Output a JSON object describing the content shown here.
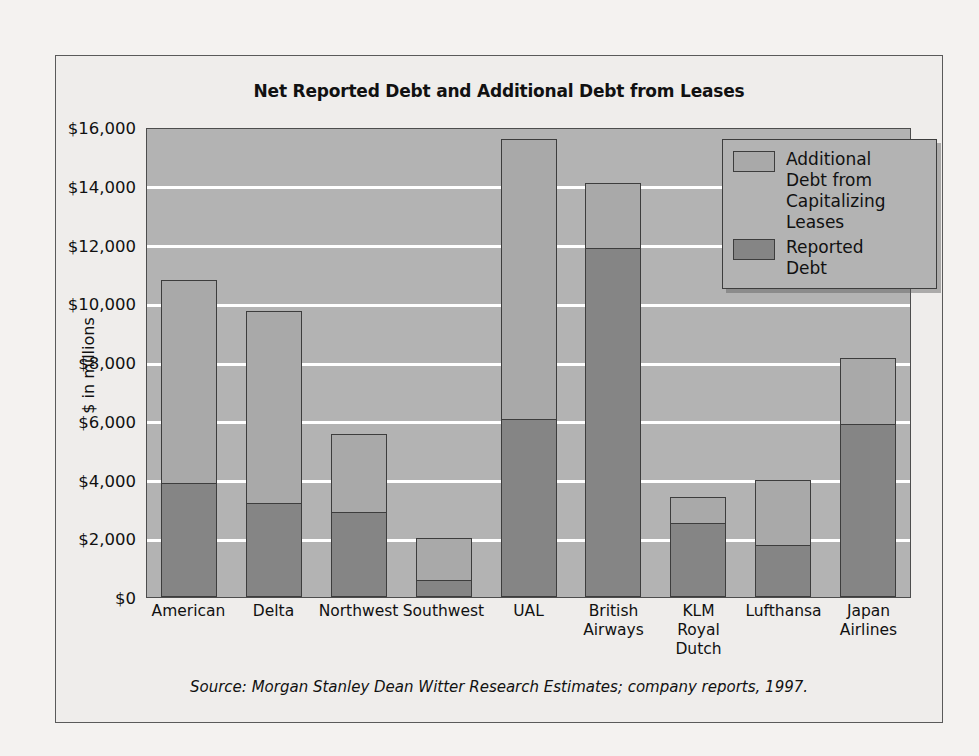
{
  "figure": {
    "title": "Net Reported Debt and Additional Debt from Leases",
    "source": "Source: Morgan Stanley Dean Witter Research Estimates; company reports, 1997.",
    "colors": {
      "page_background": "#f4f2f0",
      "frame_background": "#efedeb",
      "plot_background": "#b3b3b3",
      "gridline": "#ffffff",
      "additional_debt": "#a9a9a9",
      "reported_debt": "#858585",
      "outline": "#3d3d3d",
      "text": "#111111"
    }
  },
  "chart_data": {
    "type": "bar",
    "subtype": "stacked-vertical",
    "title": "Net Reported Debt and Additional Debt from Leases",
    "xlabel": "",
    "ylabel": "$ in millions",
    "ylim": [
      0,
      16000
    ],
    "ytick_step": 2000,
    "ytick_labels": [
      "$16,000",
      "$14,000",
      "$12,000",
      "$10,000",
      "$8,000",
      "$6,000",
      "$4,000",
      "$2,000",
      "$0"
    ],
    "ytick_values": [
      16000,
      14000,
      12000,
      10000,
      8000,
      6000,
      4000,
      2000,
      0
    ],
    "grid": true,
    "grid_axis": "y",
    "legend_position": "top-right-inside",
    "categories": [
      "American",
      "Delta",
      "Northwest",
      "Southwest",
      "UAL",
      "British Airways",
      "KLM Royal Dutch",
      "Lufthansa",
      "Japan Airlines"
    ],
    "category_label_lines": [
      [
        "American"
      ],
      [
        "Delta"
      ],
      [
        "Northwest"
      ],
      [
        "Southwest"
      ],
      [
        "UAL"
      ],
      [
        "British",
        "Airways"
      ],
      [
        "KLM",
        "Royal",
        "Dutch"
      ],
      [
        "Lufthansa"
      ],
      [
        "Japan",
        "Airlines"
      ]
    ],
    "series": [
      {
        "name": "Reported Debt",
        "color": "#858585",
        "values": [
          3880,
          3200,
          2900,
          560,
          6050,
          11900,
          2550,
          1750,
          5900
        ]
      },
      {
        "name": "Additional Debt from Capitalizing Leases",
        "color": "#a9a9a9",
        "values": [
          6920,
          6550,
          2650,
          1440,
          9550,
          2200,
          850,
          2250,
          2250
        ]
      }
    ],
    "totals": [
      10800,
      9750,
      5550,
      2000,
      15600,
      14100,
      3400,
      4000,
      8150
    ]
  },
  "legend": {
    "items": [
      {
        "label": "Additional Debt from Capitalizing Leases",
        "swatch": "additional"
      },
      {
        "label": "Reported Debt",
        "swatch": "reported"
      }
    ],
    "item_label_lines": [
      [
        "Additional",
        "Debt from",
        "Capitalizing",
        "Leases"
      ],
      [
        "Reported",
        "Debt"
      ]
    ]
  }
}
